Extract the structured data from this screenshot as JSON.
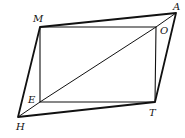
{
  "diagram": {
    "type": "geometry",
    "points": {
      "M": {
        "label": "M",
        "x": 40,
        "y": 27
      },
      "A": {
        "label": "A",
        "x": 176,
        "y": 13
      },
      "O": {
        "label": "O",
        "x": 156,
        "y": 27
      },
      "E": {
        "label": "E",
        "x": 40,
        "y": 102
      },
      "T": {
        "label": "T",
        "x": 155,
        "y": 102
      },
      "H": {
        "label": "H",
        "x": 18,
        "y": 117
      }
    },
    "segments": [
      [
        "H",
        "M"
      ],
      [
        "M",
        "A"
      ],
      [
        "A",
        "T"
      ],
      [
        "T",
        "H"
      ],
      [
        "M",
        "O"
      ],
      [
        "O",
        "T"
      ],
      [
        "T",
        "E"
      ],
      [
        "E",
        "M"
      ],
      [
        "E",
        "O"
      ],
      [
        "A",
        "O"
      ],
      [
        "E",
        "H"
      ]
    ],
    "labels": {
      "M": "M",
      "A": "A",
      "O": "O",
      "E": "E",
      "T": "T",
      "H": "H"
    },
    "colors": {
      "stroke": "#111111",
      "background": "#ffffff"
    }
  }
}
